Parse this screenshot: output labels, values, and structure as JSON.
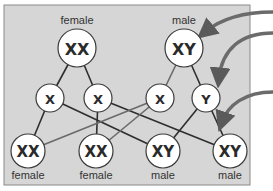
{
  "colors": {
    "panel_bg": "#d6d6d6",
    "panel_border": "#8a8a8a",
    "node_fill": "#ffffff",
    "node_stroke": "#3a3a3a",
    "line_dark": "#2e2e2e",
    "line_light": "#6a6a6a",
    "arrow": "#6b6b6b"
  },
  "parents": [
    {
      "id": "mother",
      "label": "female",
      "genotype": "XX",
      "x": 77,
      "y": 48,
      "r": 19
    },
    {
      "id": "father",
      "label": "male",
      "genotype": "XY",
      "x": 184,
      "y": 48,
      "r": 19
    }
  ],
  "gametes": [
    {
      "id": "g1",
      "chromosome": "X",
      "x": 50,
      "y": 98,
      "r": 14,
      "from": "mother"
    },
    {
      "id": "g2",
      "chromosome": "X",
      "x": 98,
      "y": 98,
      "r": 14,
      "from": "mother"
    },
    {
      "id": "g3",
      "chromosome": "X",
      "x": 160,
      "y": 98,
      "r": 14,
      "from": "father"
    },
    {
      "id": "g4",
      "chromosome": "Y",
      "x": 206,
      "y": 98,
      "r": 14,
      "from": "father"
    }
  ],
  "offspring": [
    {
      "id": "o1",
      "genotype": "XX",
      "label": "female",
      "x": 28,
      "y": 151,
      "r": 17
    },
    {
      "id": "o2",
      "genotype": "XX",
      "label": "female",
      "x": 96,
      "y": 151,
      "r": 17
    },
    {
      "id": "o3",
      "genotype": "XY",
      "label": "male",
      "x": 163,
      "y": 151,
      "r": 17
    },
    {
      "id": "o4",
      "genotype": "XY",
      "label": "male",
      "x": 230,
      "y": 151,
      "r": 17
    }
  ],
  "edges": [
    {
      "from": "mother",
      "to": "g1",
      "style": "dark"
    },
    {
      "from": "mother",
      "to": "g2",
      "style": "dark"
    },
    {
      "from": "father",
      "to": "g3",
      "style": "light"
    },
    {
      "from": "father",
      "to": "g4",
      "style": "dark"
    },
    {
      "from": "g1",
      "to": "o1",
      "style": "dark"
    },
    {
      "from": "g1",
      "to": "o3",
      "style": "dark"
    },
    {
      "from": "g2",
      "to": "o2",
      "style": "dark"
    },
    {
      "from": "g2",
      "to": "o4",
      "style": "dark"
    },
    {
      "from": "g3",
      "to": "o1",
      "style": "light"
    },
    {
      "from": "g3",
      "to": "o2",
      "style": "light"
    },
    {
      "from": "g4",
      "to": "o3",
      "style": "dark"
    },
    {
      "from": "g4",
      "to": "o4",
      "style": "dark"
    }
  ],
  "arrows": [
    {
      "id": "arrow-1",
      "path": "M 273 12 C 245 12, 222 18, 205 32"
    },
    {
      "id": "arrow-2",
      "path": "M 273 33 C 240 33, 222 50, 219 78"
    },
    {
      "id": "arrow-3",
      "path": "M 273 92 C 245 92, 228 105, 222 122"
    }
  ]
}
